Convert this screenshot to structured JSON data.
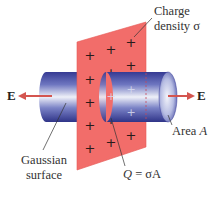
{
  "diagram": {
    "labels": {
      "charge_density_line1": "Charge",
      "charge_density_line2": "density σ",
      "e_left": "E",
      "e_right": "E",
      "area_prefix": "Area ",
      "area_var": "A",
      "gaussian_line1": "Gaussian",
      "gaussian_line2": "surface",
      "q_var": "Q",
      "q_rest": " = σA"
    },
    "plus_sign": "+",
    "colors": {
      "plane": "#f06a68",
      "plane_edge": "#e55a58",
      "cylinder_dark": "#3b3f9a",
      "cylinder_light": "#e8ecf6",
      "arrow": "#d4554f",
      "plus": "#2a1a1a",
      "leader": "#333333",
      "text": "#333333"
    }
  }
}
